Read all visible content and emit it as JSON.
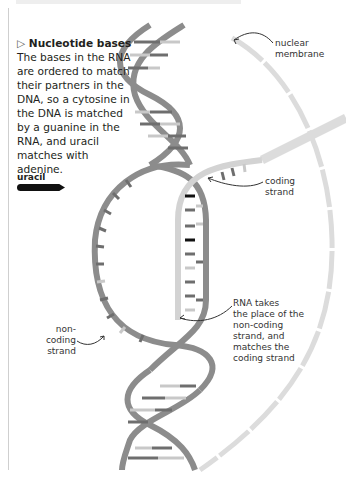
{
  "intro": {
    "marker": "▷",
    "heading": "Nucleotide bases",
    "body": "The bases in the RNA are ordered to match their partners in the DNA, so a cytosine in the DNA is matched by a guanine in the RNA, and uracil matches with adenine."
  },
  "key": {
    "uracil_label": "uracil",
    "uracil_color": "#111111"
  },
  "labels": {
    "nuclear_membrane": [
      "nuclear",
      "membrane"
    ],
    "coding_strand": [
      "coding",
      "strand"
    ],
    "non_coding_strand": [
      "non-coding",
      "strand"
    ],
    "rna_note": [
      "RNA takes",
      "the place of the",
      "non-coding",
      "strand, and",
      "matches the",
      "coding strand"
    ]
  },
  "colors": {
    "dna_strand": "#8c8c8c",
    "rna_strand": "#d3d3d3",
    "membrane": "#dcdcdc",
    "base_dark": "#6e6e6e",
    "base_light": "#c8c8c8",
    "uracil": "#111111"
  }
}
